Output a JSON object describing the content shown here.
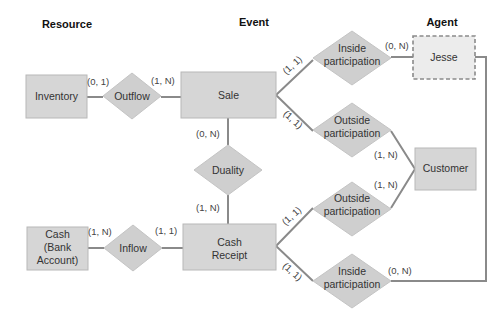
{
  "headers": {
    "resource": "Resource",
    "event": "Event",
    "agent": "Agent"
  },
  "entities": {
    "inventory": "Inventory",
    "sale": "Sale",
    "cash_line1": "Cash",
    "cash_line2": "(Bank",
    "cash_line3": "Account)",
    "cash_receipt_line1": "Cash",
    "cash_receipt_line2": "Receipt",
    "jesse": "Jesse",
    "customer": "Customer"
  },
  "relationships": {
    "outflow": "Outflow",
    "duality": "Duality",
    "inflow": "Inflow",
    "inside_top_line1": "Inside",
    "inside_top_line2": "participation",
    "outside_top_line1": "Outside",
    "outside_top_line2": "participation",
    "outside_bottom_line1": "Outside",
    "outside_bottom_line2": "participation",
    "inside_bottom_line1": "Inside",
    "inside_bottom_line2": "participation"
  },
  "cardinalities": {
    "inventory_outflow": "(0, 1)",
    "outflow_sale": "(1, N)",
    "sale_duality": "(0, N)",
    "duality_cash_receipt": "(1, N)",
    "cash_inflow": "(1, N)",
    "inflow_cash_receipt": "(1, 1)",
    "sale_inside": "(1, 1)",
    "inside_jesse": "(0, N)",
    "sale_outside": "(1, 1)",
    "outside_customer_top": "(1, N)",
    "outside_customer_bottom": "(1, N)",
    "cash_receipt_outside": "(1, 1)",
    "cash_receipt_inside": "(1, 1)",
    "inside_bottom_jesse": "(0, N)"
  },
  "colors": {
    "entity_fill": "#d6d6d6",
    "relationship_fill": "#cfcfcf",
    "connector": "#8a8a8a",
    "agent_dashed_fill": "#ececec"
  }
}
